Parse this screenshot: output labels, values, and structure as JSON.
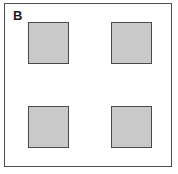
{
  "figure": {
    "panel_label": "B",
    "background_color": "#ffffff",
    "border_color": "#4f4f4f",
    "squares": [
      {
        "name": "square-top-left",
        "fill": "#c9c9c9",
        "stroke": "#4a4a4a"
      },
      {
        "name": "square-top-right",
        "fill": "#c9c9c9",
        "stroke": "#4a4a4a"
      },
      {
        "name": "square-bottom-left",
        "fill": "#c9c9c9",
        "stroke": "#4a4a4a"
      },
      {
        "name": "square-bottom-right",
        "fill": "#c9c9c9",
        "stroke": "#4a4a4a"
      }
    ]
  }
}
